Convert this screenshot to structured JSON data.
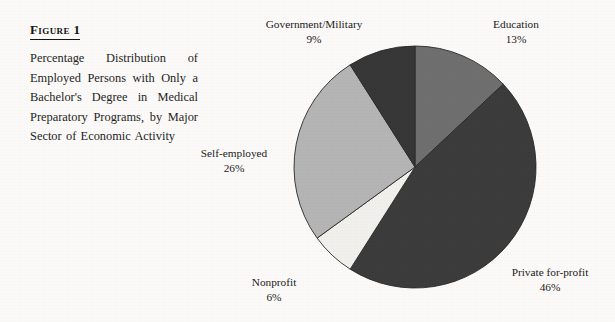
{
  "figure": {
    "label": "Figure 1",
    "caption": "Percentage Distribution of Employed Persons with Only a Bachelor's Degree in Medical Preparatory Programs, by Major Sector of Economic Activity"
  },
  "labels": {
    "government": {
      "name": "Government/Military",
      "pct": "9%"
    },
    "education": {
      "name": "Education",
      "pct": "13%"
    },
    "private": {
      "name": "Private for-profit",
      "pct": "46%"
    },
    "nonprofit": {
      "name": "Nonprofit",
      "pct": "6%"
    },
    "selfemployed": {
      "name": "Self-employed",
      "pct": "26%"
    }
  },
  "chart_data": {
    "type": "pie",
    "title": "Percentage Distribution of Employed Persons with Only a Bachelor's Degree in Medical Preparatory Programs, by Major Sector of Economic Activity",
    "xlabel": "",
    "ylabel": "",
    "units": "percent",
    "start_angle_deg": 0,
    "direction": "clockwise",
    "total": 100,
    "legend": "none-external-labels",
    "grid": false,
    "categories": [
      "Education",
      "Private for-profit",
      "Nonprofit",
      "Self-employed",
      "Government/Military"
    ],
    "values": [
      13,
      46,
      6,
      26,
      9
    ],
    "slices": [
      {
        "label": "Education",
        "value": 13,
        "display": "13%",
        "color": "#6f6f6f",
        "start_deg": 0,
        "end_deg": 46.8
      },
      {
        "label": "Private for-profit",
        "value": 46,
        "display": "46%",
        "color": "#3c3c3c",
        "start_deg": 46.8,
        "end_deg": 212.4
      },
      {
        "label": "Nonprofit",
        "value": 6,
        "display": "6%",
        "color": "#f2f0ec",
        "start_deg": 212.4,
        "end_deg": 234.0
      },
      {
        "label": "Self-employed",
        "value": 26,
        "display": "26%",
        "color": "#b5b5b5",
        "start_deg": 234.0,
        "end_deg": 327.6
      },
      {
        "label": "Government/Military",
        "value": 9,
        "display": "9%",
        "color": "#373737",
        "start_deg": 327.6,
        "end_deg": 360.0
      }
    ],
    "geometry": {
      "center_x": 415,
      "center_y": 167,
      "radius": 121
    }
  },
  "colors": {
    "page_background": "#fbfaf8",
    "ink": "#1c1c1c",
    "outline": "#2a2a2a"
  }
}
